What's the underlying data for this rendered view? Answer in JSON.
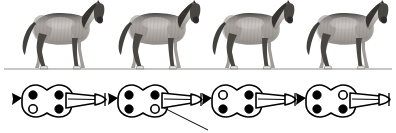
{
  "figure": {
    "background_color": "#ffffff",
    "width": 396,
    "height": 133,
    "ground_line": {
      "label": "ground-line",
      "color": "#8d8d8d",
      "y": 69,
      "x_start": 4,
      "x_end": 392
    }
  },
  "horse_row": {
    "label": "horse-gait-sequence",
    "count": 4,
    "render_style": "grayscale-engraving",
    "horses": [
      {
        "name": "horse-frame-1",
        "phase_label": "Frame 1",
        "x": 8,
        "coat_light": "#c9c5c1",
        "coat_mid": "#8f8a86",
        "coat_dark": "#4a4642",
        "mane_color": "#2f2c29",
        "hoof_highlight": "#e8e5e2",
        "legs": {
          "fore_left": "stance",
          "fore_right": "swing",
          "hind_left": "stance",
          "hind_right": "swing"
        }
      },
      {
        "name": "horse-frame-2",
        "phase_label": "Frame 2",
        "x": 104,
        "coat_light": "#c9c5c1",
        "coat_mid": "#8f8a86",
        "coat_dark": "#4a4642",
        "mane_color": "#2f2c29",
        "hoof_highlight": "#e8e5e2",
        "legs": {
          "fore_left": "swing",
          "fore_right": "stance",
          "hind_left": "stance",
          "hind_right": "swing"
        }
      },
      {
        "name": "horse-frame-3",
        "phase_label": "Frame 3",
        "x": 198,
        "coat_light": "#c9c5c1",
        "coat_mid": "#8f8a86",
        "coat_dark": "#4a4642",
        "mane_color": "#2f2c29",
        "hoof_highlight": "#e8e5e2",
        "legs": {
          "fore_left": "stance",
          "fore_right": "swing",
          "hind_left": "swing",
          "hind_right": "stance"
        }
      },
      {
        "name": "horse-frame-4",
        "phase_label": "Frame 4",
        "x": 292,
        "coat_light": "#c9c5c1",
        "coat_mid": "#8f8a86",
        "coat_dark": "#4a4642",
        "mane_color": "#2f2c29",
        "hoof_highlight": "#e8e5e2",
        "legs": {
          "fore_left": "swing",
          "fore_right": "stance",
          "hind_left": "stance",
          "hind_right": "stance"
        }
      }
    ]
  },
  "schematic_row": {
    "label": "footfall-schematic-sequence",
    "count": 4,
    "outline_color": "#000000",
    "filled_dot_color": "#000000",
    "hollow_dot_color": "#ffffff",
    "stroke_width": 1.6,
    "legend_note": "filled dot = limb bearing weight; hollow dot = limb lifted",
    "schematics": [
      {
        "name": "schematic-frame-1",
        "x": 8,
        "dots": [
          {
            "name": "dot-fore-left",
            "position": "upper-left",
            "state": "filled"
          },
          {
            "name": "dot-hind-left",
            "position": "lower-left",
            "state": "hollow"
          },
          {
            "name": "dot-fore-right",
            "position": "upper-right",
            "state": "filled"
          },
          {
            "name": "dot-hind-right",
            "position": "lower-right",
            "state": "filled"
          }
        ],
        "has_leader_line": false
      },
      {
        "name": "schematic-frame-2",
        "x": 104,
        "dots": [
          {
            "name": "dot-fore-left",
            "position": "upper-left",
            "state": "filled"
          },
          {
            "name": "dot-hind-left",
            "position": "lower-left",
            "state": "filled"
          },
          {
            "name": "dot-fore-right",
            "position": "upper-right",
            "state": "filled"
          },
          {
            "name": "dot-hind-right",
            "position": "lower-right",
            "state": "hollow"
          }
        ],
        "has_leader_line": true,
        "leader_line": {
          "name": "leader-line-callout",
          "from_x": 58,
          "from_y": 35,
          "to_x": 104,
          "to_y": 58,
          "color": "#000000"
        }
      },
      {
        "name": "schematic-frame-3",
        "x": 198,
        "dots": [
          {
            "name": "dot-fore-left",
            "position": "upper-left",
            "state": "hollow"
          },
          {
            "name": "dot-hind-left",
            "position": "lower-left",
            "state": "filled"
          },
          {
            "name": "dot-fore-right",
            "position": "upper-right",
            "state": "filled"
          },
          {
            "name": "dot-hind-right",
            "position": "lower-right",
            "state": "filled"
          }
        ],
        "has_leader_line": false
      },
      {
        "name": "schematic-frame-4",
        "x": 292,
        "dots": [
          {
            "name": "dot-fore-left",
            "position": "upper-left",
            "state": "filled"
          },
          {
            "name": "dot-hind-left",
            "position": "lower-left",
            "state": "filled"
          },
          {
            "name": "dot-fore-right",
            "position": "upper-right",
            "state": "hollow"
          },
          {
            "name": "dot-hind-right",
            "position": "lower-right",
            "state": "filled"
          }
        ],
        "has_leader_line": false
      }
    ]
  }
}
